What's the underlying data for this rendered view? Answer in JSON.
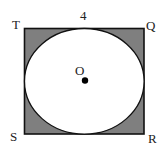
{
  "diagram": {
    "side_label": "4",
    "vertices": {
      "top_left": "T",
      "top_right": "Q",
      "bottom_right": "R",
      "bottom_left": "S"
    },
    "center_label": "O",
    "colors": {
      "shade": "#7f7f7f",
      "stroke": "#111111",
      "circle_fill": "#ffffff"
    }
  }
}
